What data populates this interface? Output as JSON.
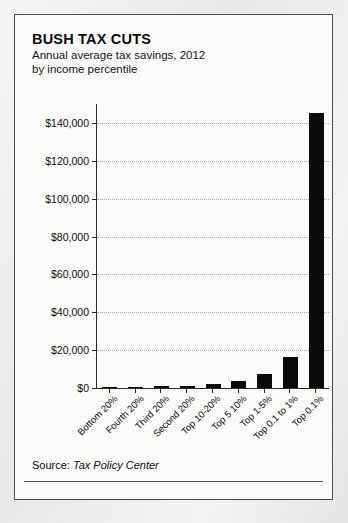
{
  "card": {
    "title": "BUSH TAX CUTS",
    "subtitle": "Annual average tax savings, 2012\nby income percentile",
    "source_prefix": "Source: ",
    "source_name": "Tax Policy Center"
  },
  "chart_data": {
    "type": "bar",
    "title": "BUSH TAX CUTS",
    "subtitle": "Annual average tax savings, 2012 by income percentile",
    "xlabel": "",
    "ylabel": "",
    "ylim": [
      0,
      150000
    ],
    "grid": true,
    "legend": "none",
    "bar_color": "#0a0a0a",
    "categories": [
      "Bottom 20%",
      "Fourth 20%",
      "Third 20%",
      "Second 20%",
      "Top 10-20%",
      "Top 5 10%",
      "Top 1-5%",
      "Top 0.1 to 1%",
      "Top 0.1%"
    ],
    "values": [
      120,
      500,
      900,
      1300,
      2000,
      3600,
      7200,
      16500,
      145000
    ],
    "ytick_values": [
      0,
      20000,
      40000,
      60000,
      80000,
      100000,
      120000,
      140000
    ],
    "ytick_labels": [
      "$0",
      "$20,000",
      "$40,000",
      "$60,000",
      "$80,000",
      "$100,000",
      "$120,000",
      "$140,000"
    ]
  }
}
